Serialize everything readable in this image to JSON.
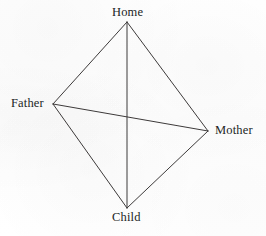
{
  "figure": {
    "background_color": "#fefefe",
    "line_color": "#3d3a3a",
    "text_color": "#221f1f",
    "line_width": 1
  },
  "nodes": {
    "home": {
      "label": "Home",
      "x": 127,
      "y": 22
    },
    "father": {
      "label": "Father",
      "x": 53,
      "y": 104
    },
    "mother": {
      "label": "Mother",
      "x": 208,
      "y": 131
    },
    "child": {
      "label": "Child",
      "x": 127,
      "y": 208
    }
  },
  "edges": [
    {
      "name": "home-father",
      "from": "home",
      "to": "father"
    },
    {
      "name": "home-mother",
      "from": "home",
      "to": "mother"
    },
    {
      "name": "father-child",
      "from": "father",
      "to": "child"
    },
    {
      "name": "mother-child",
      "from": "mother",
      "to": "child"
    },
    {
      "name": "home-child",
      "from": "home",
      "to": "child"
    },
    {
      "name": "father-mother",
      "from": "father",
      "to": "mother"
    }
  ]
}
